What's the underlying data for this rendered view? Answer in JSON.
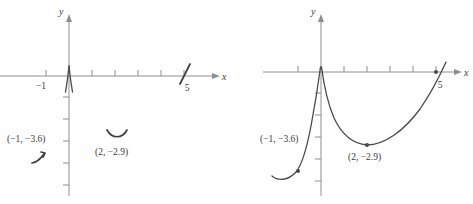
{
  "figure": {
    "background": "#ffffff",
    "axis_color": "#8e8e8e",
    "curve_color": "#4a4a4a",
    "text_color": "#3a3a3a"
  },
  "panels": [
    {
      "id": "left",
      "name": "partial-graph-panel",
      "axis_labels": {
        "x": "x",
        "y": "y"
      },
      "x_tick_labels": [
        {
          "value": -1,
          "text": "−1"
        },
        {
          "value": 5,
          "text": "5"
        }
      ],
      "x_ticks": [
        -1,
        1,
        2,
        3,
        4,
        5
      ],
      "y_ticks": [
        -1,
        -2,
        -3,
        -4,
        -5
      ],
      "point_labels": [
        {
          "text": "(−1, −3.6)"
        },
        {
          "text": "(2, −2.9)"
        }
      ],
      "features": [
        "cusp-at-origin",
        "slope-fragment-near-x-5",
        "curve-fragment-near-point-a",
        "curve-fragment-near-point-b"
      ]
    },
    {
      "id": "right",
      "name": "complete-graph-panel",
      "axis_labels": {
        "x": "x",
        "y": "y"
      },
      "x_tick_labels": [
        {
          "value": 5,
          "text": "5"
        }
      ],
      "x_ticks": [
        -1,
        1,
        2,
        3,
        4,
        5
      ],
      "y_ticks": [
        -1,
        -2,
        -3,
        -4,
        -5
      ],
      "point_labels": [
        {
          "text": "(−1, −3.6)"
        },
        {
          "text": "(2, −2.9)"
        }
      ],
      "marked_points": [
        {
          "x": -1,
          "y": -3.6
        },
        {
          "x": 2,
          "y": -2.9
        },
        {
          "x": 5,
          "y": 0
        }
      ],
      "features": [
        "cusp-at-origin",
        "left-branch-increasing",
        "right-branch-minimum-at-2",
        "x-intercept-at-5"
      ]
    }
  ]
}
